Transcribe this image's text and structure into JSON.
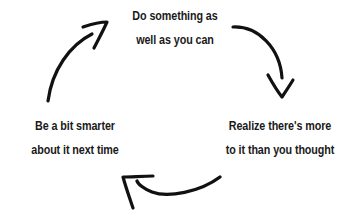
{
  "diagram": {
    "type": "cycle",
    "nodes": [
      {
        "id": "top",
        "lines": [
          "Do something as",
          "well as you can"
        ]
      },
      {
        "id": "right",
        "lines": [
          "Realize there's more",
          "to it than you thought"
        ]
      },
      {
        "id": "left",
        "lines": [
          "Be a bit smarter",
          "about it next time"
        ]
      }
    ],
    "edges": [
      {
        "from": "top",
        "to": "right",
        "direction": "clockwise"
      },
      {
        "from": "right",
        "to": "left",
        "direction": "clockwise"
      },
      {
        "from": "left",
        "to": "top",
        "direction": "clockwise"
      }
    ],
    "colors": {
      "text": "#1a1a1a",
      "arrow": "#111111",
      "background": "#ffffff"
    }
  }
}
